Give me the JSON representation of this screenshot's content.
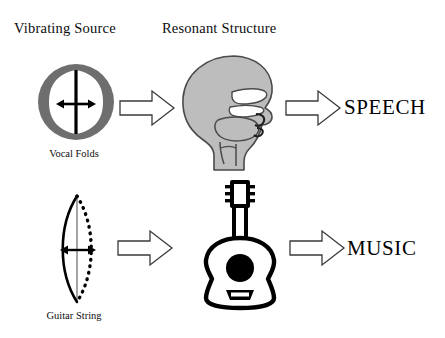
{
  "diagram": {
    "columns": {
      "source_header": "Vibrating Source",
      "resonant_header": "Resonant Structure"
    },
    "rows": [
      {
        "id": "speech",
        "source_label": "Vocal Folds",
        "source_icon": "vocal-folds-icon",
        "resonator_icon": "head-vocal-tract-icon",
        "output_label": "SPEECH",
        "arrow_source_to_resonator": "block-arrow-right-icon",
        "arrow_resonator_to_output": "block-arrow-right-icon"
      },
      {
        "id": "music",
        "source_label": "Guitar String",
        "source_icon": "vibrating-string-icon",
        "resonator_icon": "acoustic-guitar-icon",
        "output_label": "MUSIC",
        "arrow_source_to_resonator": "block-arrow-right-icon",
        "arrow_resonator_to_output": "block-arrow-right-icon"
      }
    ],
    "colors": {
      "background": "#ffffff",
      "ink": "#000000",
      "folds_ring_gray": "#6e6e6e",
      "head_gray": "#bdbdbd",
      "head_outline": "#4a4a4a",
      "arrow_fill": "#ffffff",
      "arrow_stroke": "#3a3a3a"
    }
  }
}
